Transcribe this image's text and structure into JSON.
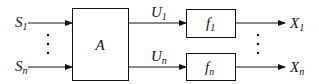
{
  "diagram": {
    "inputs": [
      {
        "label": "S",
        "sub": "1"
      },
      {
        "label": "S",
        "sub": "n"
      }
    ],
    "block_main": {
      "label": "A"
    },
    "intermediate": [
      {
        "label": "U",
        "sub": "1"
      },
      {
        "label": "U",
        "sub": "n"
      }
    ],
    "blocks_f": [
      {
        "label": "f",
        "sub": "1"
      },
      {
        "label": "f",
        "sub": "n"
      }
    ],
    "outputs": [
      {
        "label": "X",
        "sub": "1"
      },
      {
        "label": "X",
        "sub": "n"
      }
    ],
    "ellipsis": "⋮"
  }
}
